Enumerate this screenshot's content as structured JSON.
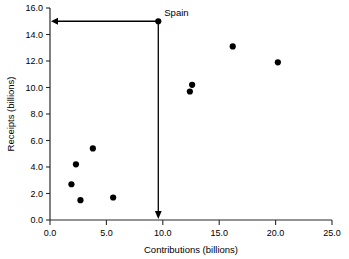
{
  "chart_data": {
    "type": "scatter",
    "title": "",
    "xlabel": "Contributions (billions)",
    "ylabel": "Receipts (billions)",
    "xlim": [
      0.0,
      25.0
    ],
    "ylim": [
      0.0,
      16.0
    ],
    "xticks": [
      "0.0",
      "5.0",
      "10.0",
      "15.0",
      "20.0",
      "25.0"
    ],
    "yticks": [
      "0.0",
      "2.0",
      "4.0",
      "6.0",
      "8.0",
      "10.0",
      "12.0",
      "14.0",
      "16.0"
    ],
    "xtick_values": [
      0.0,
      5.0,
      10.0,
      15.0,
      20.0,
      25.0
    ],
    "ytick_values": [
      0.0,
      2.0,
      4.0,
      6.0,
      8.0,
      10.0,
      12.0,
      14.0,
      16.0
    ],
    "grid": false,
    "legend": false,
    "marker_color": "#000000",
    "points": [
      {
        "x": 1.9,
        "y": 2.7,
        "label": ""
      },
      {
        "x": 2.3,
        "y": 4.2,
        "label": ""
      },
      {
        "x": 2.7,
        "y": 1.5,
        "label": ""
      },
      {
        "x": 3.8,
        "y": 5.4,
        "label": ""
      },
      {
        "x": 5.6,
        "y": 1.7,
        "label": ""
      },
      {
        "x": 12.4,
        "y": 9.7,
        "label": ""
      },
      {
        "x": 12.6,
        "y": 10.2,
        "label": ""
      },
      {
        "x": 16.2,
        "y": 13.1,
        "label": ""
      },
      {
        "x": 20.2,
        "y": 11.9,
        "label": ""
      },
      {
        "x": 9.6,
        "y": 15.0,
        "label": "Spain"
      }
    ],
    "annotations": [
      {
        "name": "spain-callout",
        "text": "Spain",
        "point_x": 9.6,
        "point_y": 15.0,
        "arrow_to_y_axis": true,
        "arrow_to_x_axis": true
      }
    ]
  },
  "axes": {
    "x_title": "Contributions (billions)",
    "y_title": "Receipts (billions)"
  }
}
